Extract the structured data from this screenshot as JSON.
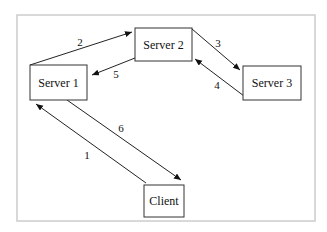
{
  "diagram": {
    "frame": {
      "x": 17,
      "y": 15,
      "w": 298,
      "h": 206,
      "stroke": "#cccccc"
    },
    "nodes": [
      {
        "id": "server1",
        "label": "Server 1",
        "x": 30,
        "y": 65,
        "w": 57,
        "h": 35
      },
      {
        "id": "server2",
        "label": "Server 2",
        "x": 135,
        "y": 28,
        "w": 57,
        "h": 33
      },
      {
        "id": "server3",
        "label": "Server 3",
        "x": 243,
        "y": 66,
        "w": 58,
        "h": 34
      },
      {
        "id": "client",
        "label": "Client",
        "x": 144,
        "y": 185,
        "w": 40,
        "h": 32
      }
    ],
    "edges": [
      {
        "label": "1",
        "from": "client",
        "to": "server1",
        "x1": 146,
        "y1": 183,
        "x2": 36,
        "y2": 104,
        "lx": 87,
        "ly": 159
      },
      {
        "label": "2",
        "from": "server1",
        "to": "server2",
        "x1": 30,
        "y1": 65,
        "x2": 132,
        "y2": 32,
        "lx": 80,
        "ly": 46
      },
      {
        "label": "3",
        "from": "server2",
        "to": "server3",
        "x1": 192,
        "y1": 29,
        "x2": 240,
        "y2": 70,
        "lx": 218,
        "ly": 47
      },
      {
        "label": "4",
        "from": "server3",
        "to": "server2",
        "x1": 244,
        "y1": 96,
        "x2": 195,
        "y2": 59,
        "lx": 217,
        "ly": 89
      },
      {
        "label": "5",
        "from": "server2",
        "to": "server1",
        "x1": 135,
        "y1": 58,
        "x2": 92,
        "y2": 75,
        "lx": 116,
        "ly": 78
      },
      {
        "label": "6",
        "from": "server1",
        "to": "client",
        "x1": 67,
        "y1": 100,
        "x2": 181,
        "y2": 180,
        "lx": 121,
        "ly": 132
      }
    ]
  }
}
